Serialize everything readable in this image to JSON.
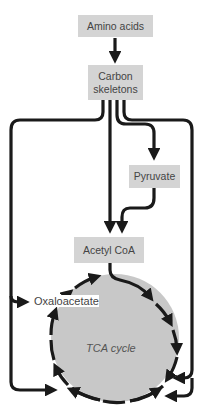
{
  "diagram": {
    "nodes": {
      "amino_acids": "Amino acids",
      "carbon_skeletons_line1": "Carbon",
      "carbon_skeletons_line2": "skeletons",
      "pyruvate": "Pyruvate",
      "acetyl_coa": "Acetyl CoA",
      "oxaloacetate": "Oxaloacetate",
      "tca_cycle": "TCA cycle"
    },
    "colors": {
      "box_fill": "#d4d4d4",
      "circle_fill": "#c8c8c8",
      "line": "#1a1a1a",
      "text": "#444444"
    },
    "edges": [
      {
        "from": "Amino acids",
        "to": "Carbon skeletons"
      },
      {
        "from": "Carbon skeletons",
        "to": "Pyruvate"
      },
      {
        "from": "Carbon skeletons",
        "to": "Acetyl CoA"
      },
      {
        "from": "Pyruvate",
        "to": "Acetyl CoA"
      },
      {
        "from": "Acetyl CoA",
        "to": "TCA cycle"
      },
      {
        "from": "Carbon skeletons",
        "to": "Oxaloacetate"
      },
      {
        "from": "Carbon skeletons",
        "to": "TCA cycle (bottom-left)"
      },
      {
        "from": "Carbon skeletons",
        "to": "TCA cycle (right)"
      },
      {
        "from": "Carbon skeletons",
        "to": "TCA cycle (bottom-right)"
      }
    ]
  }
}
